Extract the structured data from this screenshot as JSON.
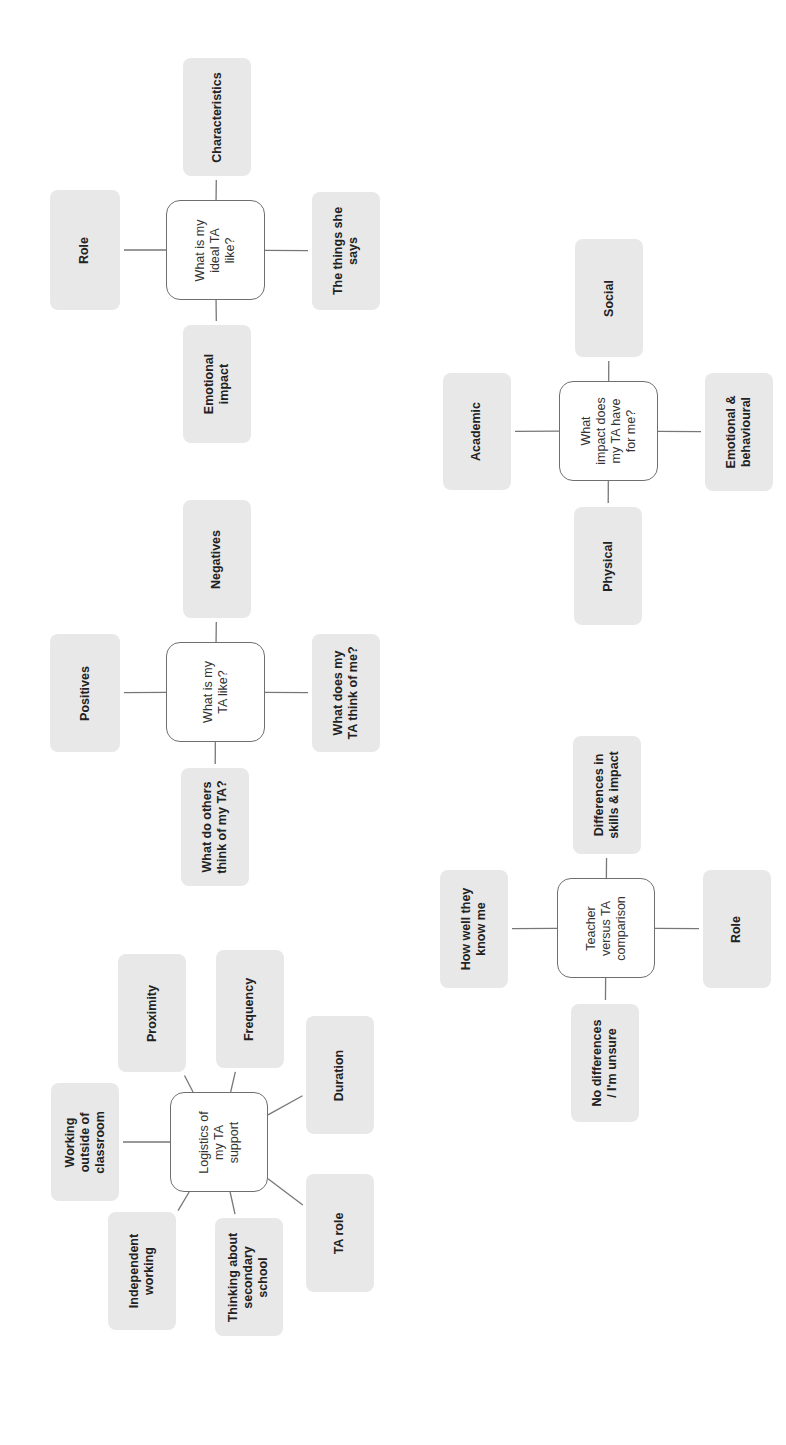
{
  "diagram": {
    "orientation": "rotated-90-ccw",
    "colors": {
      "leaf_fill": "#e8e8e8",
      "hub_border": "#6f6f6f",
      "line": "#777777",
      "text": "#222222"
    },
    "clusters": [
      {
        "id": "ideal",
        "hub": {
          "label": "What is my\nideal TA\nlike?",
          "x": 166,
          "y": 200,
          "w": 99,
          "h": 100
        },
        "leaves": [
          {
            "label": "Role",
            "x": 50,
            "y": 190,
            "w": 70,
            "h": 120
          },
          {
            "label": "Characteristics",
            "x": 183,
            "y": 58,
            "w": 68,
            "h": 118
          },
          {
            "label": "The things she\nsays",
            "x": 312,
            "y": 192,
            "w": 68,
            "h": 118
          },
          {
            "label": "Emotional\nimpact",
            "x": 183,
            "y": 325,
            "w": 68,
            "h": 118
          }
        ]
      },
      {
        "id": "like",
        "hub": {
          "label": "What is my\nTA like?",
          "x": 166,
          "y": 642,
          "w": 99,
          "h": 100
        },
        "leaves": [
          {
            "label": "Positives",
            "x": 50,
            "y": 634,
            "w": 70,
            "h": 118
          },
          {
            "label": "Negatives",
            "x": 183,
            "y": 500,
            "w": 68,
            "h": 118
          },
          {
            "label": "What does my\nTA think of me?",
            "x": 312,
            "y": 634,
            "w": 68,
            "h": 118
          },
          {
            "label": "What do others\nthink of my TA?",
            "x": 181,
            "y": 768,
            "w": 68,
            "h": 118
          }
        ]
      },
      {
        "id": "logistics",
        "hub": {
          "label": "Logistics of\nmy TA\nsupport",
          "x": 170,
          "y": 1092,
          "w": 98,
          "h": 100
        },
        "leaves": [
          {
            "label": "Working\noutside of\nclassroom",
            "x": 51,
            "y": 1083,
            "w": 68,
            "h": 118
          },
          {
            "label": "Proximity",
            "x": 118,
            "y": 954,
            "w": 68,
            "h": 118
          },
          {
            "label": "Frequency",
            "x": 216,
            "y": 950,
            "w": 68,
            "h": 118
          },
          {
            "label": "Duration",
            "x": 306,
            "y": 1016,
            "w": 68,
            "h": 118
          },
          {
            "label": "TA role",
            "x": 306,
            "y": 1174,
            "w": 68,
            "h": 118
          },
          {
            "label": "Thinking about\nsecondary\nschool",
            "x": 215,
            "y": 1218,
            "w": 68,
            "h": 118
          },
          {
            "label": "Independent\nworking",
            "x": 108,
            "y": 1212,
            "w": 68,
            "h": 118
          }
        ]
      },
      {
        "id": "impact",
        "hub": {
          "label": "What\nimpact does\nmy TA have\nfor me?",
          "x": 559,
          "y": 381,
          "w": 99,
          "h": 100
        },
        "leaves": [
          {
            "label": "Academic",
            "x": 443,
            "y": 373,
            "w": 68,
            "h": 117
          },
          {
            "label": "Social",
            "x": 575,
            "y": 239,
            "w": 68,
            "h": 118
          },
          {
            "label": "Emotional &\nbehavioural",
            "x": 705,
            "y": 373,
            "w": 68,
            "h": 118
          },
          {
            "label": "Physical",
            "x": 574,
            "y": 507,
            "w": 68,
            "h": 118
          }
        ]
      },
      {
        "id": "teacher",
        "hub": {
          "label": "Teacher\nversus TA\ncomparison",
          "x": 557,
          "y": 878,
          "w": 98,
          "h": 100
        },
        "leaves": [
          {
            "label": "How well they\nknow me",
            "x": 440,
            "y": 870,
            "w": 68,
            "h": 118
          },
          {
            "label": "Differences in\nskills & impact",
            "x": 573,
            "y": 736,
            "w": 68,
            "h": 118
          },
          {
            "label": "Role",
            "x": 703,
            "y": 870,
            "w": 68,
            "h": 118
          },
          {
            "label": "No differences\n/ I'm unsure",
            "x": 571,
            "y": 1004,
            "w": 68,
            "h": 118
          }
        ]
      }
    ]
  }
}
